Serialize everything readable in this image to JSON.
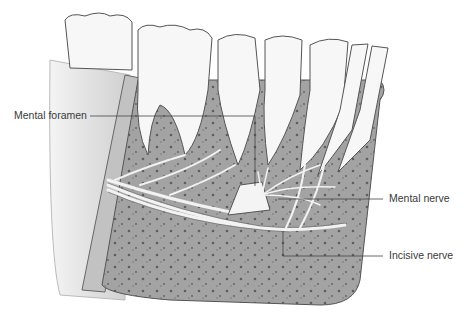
{
  "figure": {
    "labels": [
      {
        "id": "mental-foramen",
        "text": "Mental foramen"
      },
      {
        "id": "mental-nerve",
        "text": "Mental nerve"
      },
      {
        "id": "incisive-nerve",
        "text": "Incisive nerve"
      }
    ]
  },
  "colors": {
    "bone": "#9a9a9a",
    "bone_dark": "#6e6e6e",
    "cortex": "#d8d8d8",
    "tooth": "#f7f7f7",
    "outline": "#4a4a4a",
    "leader": "#444444"
  }
}
